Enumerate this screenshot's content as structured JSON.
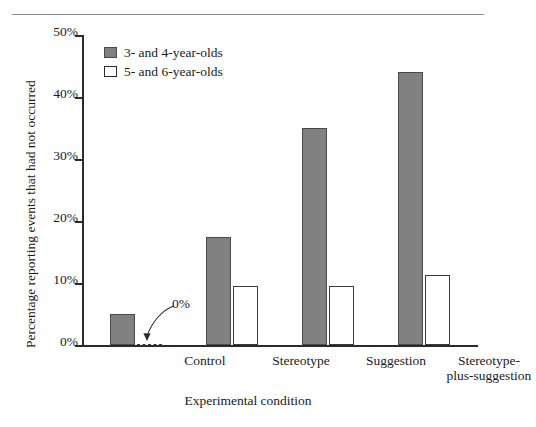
{
  "chart_data": {
    "type": "bar",
    "title": "",
    "subtitle": "",
    "xlabel": "Experimental condition",
    "ylabel": "Percentage reporting events that had not occurred",
    "categories": [
      "Control",
      "Stereotype",
      "Suggestion",
      "Stereotype-\nplus-suggestion"
    ],
    "series": [
      {
        "name": "3- and 4-year-olds",
        "color": "#808080",
        "style": "filled",
        "values": [
          5.0,
          17.5,
          35.0,
          44.0
        ]
      },
      {
        "name": "5- and 6-year-olds",
        "color": "#ffffff",
        "style": "hollow",
        "values": [
          0.0,
          9.5,
          9.5,
          11.3
        ]
      }
    ],
    "ylim": [
      0,
      50
    ],
    "yticks": [
      0,
      10,
      20,
      30,
      40,
      50
    ],
    "ytick_labels": [
      "0%",
      "10%",
      "20%",
      "30%",
      "40%",
      "50%"
    ],
    "grid": false,
    "legend_position": "top-left-inside",
    "annotations": [
      {
        "text": "0%",
        "points_to": "Control / 5- and 6-year-olds bar",
        "value": 0
      }
    ]
  },
  "legend": {
    "items": [
      {
        "label": "3- and 4-year-olds",
        "swatch": "filled-gray-square"
      },
      {
        "label": "5- and 6-year-olds",
        "swatch": "hollow-white-square"
      }
    ]
  },
  "axes": {
    "y_title": "Percentage reporting events that had not occurred",
    "x_title": "Experimental condition",
    "y_tick_labels": [
      "50%",
      "40%",
      "30%",
      "20%",
      "10%",
      "0%"
    ],
    "x_tick_labels": [
      "Control",
      "Stereotype",
      "Suggestion",
      "Stereotype-\nplus-suggestion"
    ]
  },
  "annotation": {
    "zero_label": "0%"
  },
  "colors": {
    "bar_filled": "#808080",
    "bar_filled_border": "#4a4a4a",
    "bar_hollow": "#ffffff",
    "bar_hollow_border": "#3a3a3a",
    "axis": "#2b2b2b",
    "text": "#1a1a1a",
    "rule": "#8a8a8a",
    "background": "#ffffff"
  }
}
